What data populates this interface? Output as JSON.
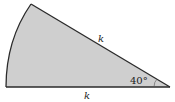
{
  "diagram": {
    "shape": "circular-sector",
    "fill_color": "#cfcfcf",
    "stroke_color": "#2a2a2a",
    "labels": {
      "radius_slant": "k",
      "radius_base": "k",
      "angle": "40°"
    }
  }
}
